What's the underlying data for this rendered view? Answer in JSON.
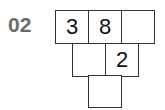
{
  "puzzle": {
    "number": "02",
    "rows": [
      [
        "3",
        "8",
        ""
      ],
      [
        "",
        "2"
      ],
      [
        ""
      ]
    ]
  }
}
